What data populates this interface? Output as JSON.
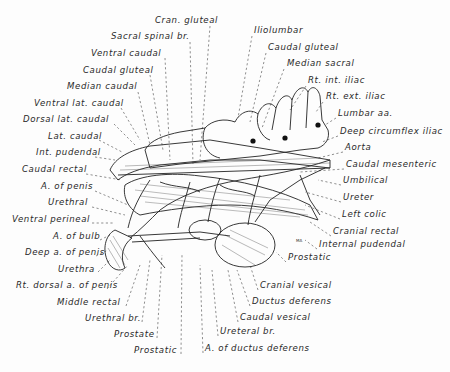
{
  "figure": {
    "artist_initials": "MA"
  },
  "labels_left": [
    {
      "id": "cran-gluteal",
      "text": "Cran. gluteal",
      "x": 155,
      "y": 20
    },
    {
      "id": "sacral-spinal-br",
      "text": "Sacral spinal br.",
      "x": 111,
      "y": 36
    },
    {
      "id": "ventral-caudal",
      "text": "Ventral caudal",
      "x": 91,
      "y": 53
    },
    {
      "id": "caudal-gluteal-left",
      "text": "Caudal gluteal",
      "x": 83,
      "y": 70
    },
    {
      "id": "median-caudal",
      "text": "Median caudal",
      "x": 67,
      "y": 86
    },
    {
      "id": "ventral-lat-caudal",
      "text": "Ventral lat. caudal",
      "x": 34,
      "y": 103
    },
    {
      "id": "dorsal-lat-caudal",
      "text": "Dorsal lat. caudal",
      "x": 23,
      "y": 119
    },
    {
      "id": "lat-caudal",
      "text": "Lat. caudal",
      "x": 48,
      "y": 136
    },
    {
      "id": "int-pudendal",
      "text": "Int. pudendal",
      "x": 36,
      "y": 152
    },
    {
      "id": "caudal-rectal",
      "text": "Caudal rectal",
      "x": 22,
      "y": 169
    },
    {
      "id": "a-of-penis",
      "text": "A. of penis",
      "x": 41,
      "y": 186
    },
    {
      "id": "urethral",
      "text": "Urethral",
      "x": 48,
      "y": 202
    },
    {
      "id": "ventral-perineal",
      "text": "Ventral perineal",
      "x": 12,
      "y": 219
    },
    {
      "id": "a-of-bulb",
      "text": "A. of bulb",
      "x": 53,
      "y": 236
    },
    {
      "id": "deep-a-of-penis",
      "text": "Deep a. of penis",
      "x": 25,
      "y": 252
    },
    {
      "id": "urethra",
      "text": "Urethra",
      "x": 58,
      "y": 269
    },
    {
      "id": "rt-dorsal-a-of-penis",
      "text": "Rt. dorsal a. of penis",
      "x": 16,
      "y": 285
    },
    {
      "id": "middle-rectal",
      "text": "Middle rectal",
      "x": 57,
      "y": 302
    },
    {
      "id": "urethral-br",
      "text": "Urethral br.",
      "x": 85,
      "y": 318
    },
    {
      "id": "prostate",
      "text": "Prostate",
      "x": 114,
      "y": 334
    },
    {
      "id": "prostatic-bottom",
      "text": "Prostatic",
      "x": 134,
      "y": 350
    }
  ],
  "labels_right": [
    {
      "id": "iliolumbar",
      "text": "Iliolumbar",
      "x": 254,
      "y": 30
    },
    {
      "id": "caudal-gluteal-right",
      "text": "Caudal gluteal",
      "x": 268,
      "y": 47
    },
    {
      "id": "median-sacral",
      "text": "Median sacral",
      "x": 287,
      "y": 63
    },
    {
      "id": "rt-int-iliac",
      "text": "Rt. int. iliac",
      "x": 308,
      "y": 80
    },
    {
      "id": "rt-ext-iliac",
      "text": "Rt. ext. iliac",
      "x": 326,
      "y": 96
    },
    {
      "id": "lumbar-aa",
      "text": "Lumbar aa.",
      "x": 338,
      "y": 113
    },
    {
      "id": "deep-circumflex-iliac",
      "text": "Deep circumflex iliac",
      "x": 340,
      "y": 131
    },
    {
      "id": "aorta",
      "text": "Aorta",
      "x": 345,
      "y": 147
    },
    {
      "id": "caudal-mesenteric",
      "text": "Caudal mesenteric",
      "x": 346,
      "y": 164
    },
    {
      "id": "umbilical",
      "text": "Umbilical",
      "x": 343,
      "y": 180
    },
    {
      "id": "ureter",
      "text": "Ureter",
      "x": 343,
      "y": 197
    },
    {
      "id": "left-colic",
      "text": "Left colic",
      "x": 342,
      "y": 214
    },
    {
      "id": "cranial-rectal",
      "text": "Cranial rectal",
      "x": 333,
      "y": 231
    },
    {
      "id": "internal-pudendal",
      "text": "Internal pudendal",
      "x": 319,
      "y": 244
    },
    {
      "id": "prostatic-right",
      "text": "Prostatic",
      "x": 288,
      "y": 257
    },
    {
      "id": "cranial-vesical",
      "text": "Cranial vesical",
      "x": 260,
      "y": 285
    },
    {
      "id": "ductus-deferens",
      "text": "Ductus deferens",
      "x": 252,
      "y": 301
    },
    {
      "id": "caudal-vesical",
      "text": "Caudal vesical",
      "x": 240,
      "y": 317
    },
    {
      "id": "ureteral-br",
      "text": "Ureteral br.",
      "x": 220,
      "y": 331
    },
    {
      "id": "a-of-ductus-deferens",
      "text": "A. of ductus deferens",
      "x": 205,
      "y": 348
    }
  ]
}
